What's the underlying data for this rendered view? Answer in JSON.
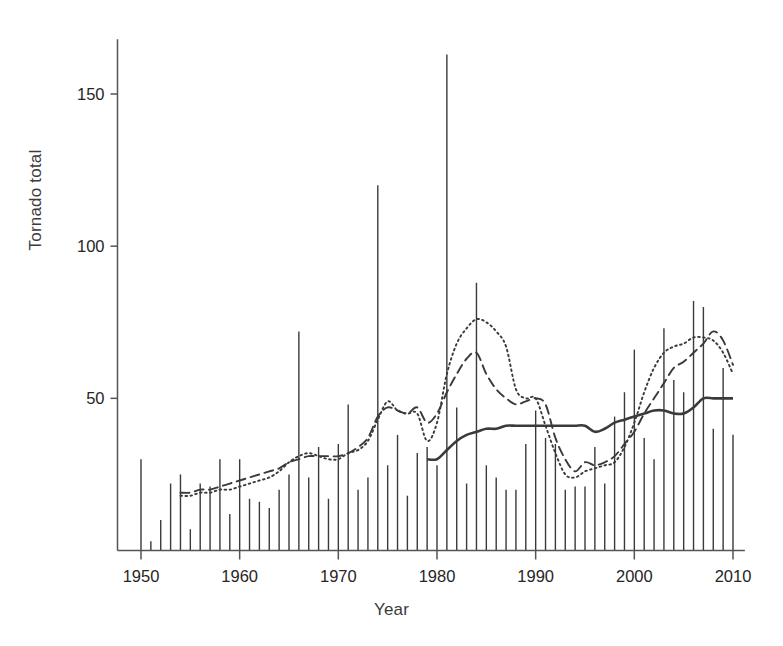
{
  "chart_data": {
    "type": "bar",
    "title": "",
    "xlabel": "Year",
    "ylabel": "Tornado total",
    "xlim": [
      1948,
      2011
    ],
    "ylim": [
      0,
      168
    ],
    "grid": false,
    "legend": "none",
    "xticks": [
      1950,
      1960,
      1970,
      1980,
      1990,
      2000,
      2010
    ],
    "yticks": [
      50,
      100,
      150
    ],
    "xtick_labels": [
      "1950",
      "1960",
      "1970",
      "1980",
      "1990",
      "2000",
      "2010"
    ],
    "ytick_labels": [
      "50",
      "100",
      "150"
    ],
    "categories": [
      1950,
      1951,
      1952,
      1953,
      1954,
      1955,
      1956,
      1957,
      1958,
      1959,
      1960,
      1961,
      1962,
      1963,
      1964,
      1965,
      1966,
      1967,
      1968,
      1969,
      1970,
      1971,
      1972,
      1973,
      1974,
      1975,
      1976,
      1977,
      1978,
      1979,
      1980,
      1981,
      1982,
      1983,
      1984,
      1985,
      1986,
      1987,
      1988,
      1989,
      1990,
      1991,
      1992,
      1993,
      1994,
      1995,
      1996,
      1997,
      1998,
      1999,
      2000,
      2001,
      2002,
      2003,
      2004,
      2005,
      2006,
      2007,
      2008,
      2009,
      2010
    ],
    "values": [
      30,
      3,
      10,
      22,
      25,
      7,
      22,
      21,
      30,
      12,
      30,
      17,
      16,
      14,
      20,
      25,
      72,
      24,
      34,
      17,
      35,
      48,
      20,
      24,
      120,
      28,
      38,
      18,
      32,
      34,
      28,
      163,
      47,
      22,
      88,
      28,
      24,
      20,
      20,
      35,
      46,
      37,
      35,
      20,
      21,
      21,
      34,
      22,
      44,
      52,
      66,
      37,
      30,
      73,
      56,
      52,
      82,
      80,
      40,
      60,
      38
    ],
    "series": [
      {
        "name": "dotted-trend",
        "style": "dotted",
        "x": [
          1954,
          1955,
          1956,
          1957,
          1958,
          1959,
          1960,
          1961,
          1962,
          1963,
          1964,
          1965,
          1966,
          1967,
          1968,
          1969,
          1970,
          1971,
          1972,
          1973,
          1974,
          1975,
          1976,
          1977,
          1978,
          1979,
          1980,
          1981,
          1982,
          1983,
          1984,
          1985,
          1986,
          1987,
          1988,
          1989,
          1990,
          1991,
          1992,
          1993,
          1994,
          1995,
          1996,
          1997,
          1998,
          1999,
          2000,
          2001,
          2002,
          2003,
          2004,
          2005,
          2006,
          2007,
          2008,
          2009,
          2010
        ],
        "values": [
          18,
          18,
          19,
          19,
          20,
          20,
          21,
          22,
          23,
          24,
          26,
          29,
          31,
          32,
          31,
          30,
          30,
          32,
          33,
          36,
          43,
          49,
          46,
          45,
          45,
          36,
          42,
          58,
          68,
          73,
          76,
          75,
          72,
          67,
          53,
          50,
          50,
          41,
          32,
          25,
          24,
          26,
          27,
          28,
          29,
          34,
          42,
          52,
          60,
          65,
          67,
          68,
          70,
          70,
          69,
          65,
          58
        ]
      },
      {
        "name": "dashed-trend",
        "style": "dashed",
        "x": [
          1954,
          1955,
          1956,
          1957,
          1958,
          1959,
          1960,
          1961,
          1962,
          1963,
          1964,
          1965,
          1966,
          1967,
          1968,
          1969,
          1970,
          1971,
          1972,
          1973,
          1974,
          1975,
          1976,
          1977,
          1978,
          1979,
          1980,
          1981,
          1982,
          1983,
          1984,
          1985,
          1986,
          1987,
          1988,
          1989,
          1990,
          1991,
          1992,
          1993,
          1994,
          1995,
          1996,
          1997,
          1998,
          1999,
          2000,
          2001,
          2002,
          2003,
          2004,
          2005,
          2006,
          2007,
          2008,
          2009,
          2010
        ],
        "values": [
          19,
          19,
          20,
          20,
          21,
          22,
          23,
          24,
          25,
          26,
          27,
          29,
          30,
          31,
          31,
          31,
          31,
          32,
          34,
          37,
          44,
          47,
          46,
          45,
          47,
          42,
          45,
          52,
          58,
          63,
          65,
          58,
          53,
          50,
          48,
          49,
          50,
          48,
          37,
          30,
          26,
          29,
          28,
          29,
          31,
          35,
          39,
          45,
          50,
          55,
          60,
          62,
          65,
          68,
          72,
          69,
          61
        ]
      },
      {
        "name": "solid-trend",
        "style": "solid",
        "x": [
          1979,
          1980,
          1981,
          1982,
          1983,
          1984,
          1985,
          1986,
          1987,
          1988,
          1989,
          1990,
          1991,
          1992,
          1993,
          1994,
          1995,
          1996,
          1997,
          1998,
          1999,
          2000,
          2001,
          2002,
          2003,
          2004,
          2005,
          2006,
          2007,
          2008,
          2009,
          2010
        ],
        "values": [
          30,
          30,
          33,
          36,
          38,
          39,
          40,
          40,
          41,
          41,
          41,
          41,
          41,
          41,
          41,
          41,
          41,
          39,
          40,
          42,
          43,
          44,
          45,
          46,
          46,
          45,
          45,
          47,
          50,
          50,
          50,
          50
        ]
      }
    ],
    "colors": {
      "bars": "#3a3a3a",
      "dotted": "#3a3a3a",
      "dashed": "#3a3a3a",
      "solid": "#3a3a3a",
      "axis": "#555555",
      "background": "#ffffff"
    }
  }
}
